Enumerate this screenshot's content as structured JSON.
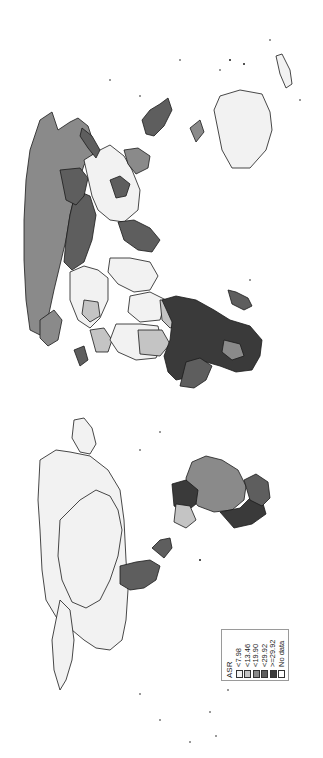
{
  "map": {
    "type": "choropleth",
    "orientation": "rotated -90deg (north points left)",
    "colors": {
      "background": "#ffffff",
      "border": "#1a1a1a",
      "class_1": "#f2f2f2",
      "class_2": "#c4c4c4",
      "class_3": "#8a8a8a",
      "class_4": "#5e5e5e",
      "class_5": "#3a3a3a",
      "no_data": "#ffffff"
    }
  },
  "legend": {
    "title": "ASR",
    "items": [
      {
        "label": "<7.98",
        "color": "#f2f2f2"
      },
      {
        "label": "<13.46",
        "color": "#c4c4c4"
      },
      {
        "label": "<19.90",
        "color": "#8a8a8a"
      },
      {
        "label": "<29.92",
        "color": "#5e5e5e"
      },
      {
        "label": ">=29.92",
        "color": "#3a3a3a"
      },
      {
        "label": "No data",
        "color": "#ffffff"
      }
    ]
  }
}
